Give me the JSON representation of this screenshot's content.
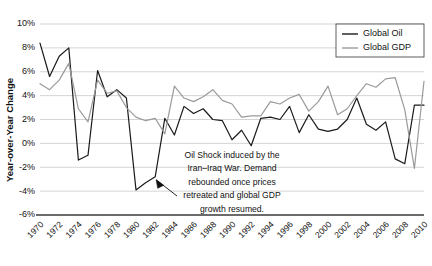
{
  "chart_data": {
    "type": "line",
    "title": "",
    "xlabel": "",
    "ylabel": "Year-over-Year Change",
    "ylim": [
      -6,
      10
    ],
    "xlim": [
      1970,
      2010
    ],
    "ytick_labels": [
      "10%",
      "8%",
      "6%",
      "4%",
      "2%",
      "0%",
      "-2%",
      "-4%",
      "-6%"
    ],
    "ytick_values": [
      10,
      8,
      6,
      4,
      2,
      0,
      -2,
      -4,
      -6
    ],
    "xtick_labels": [
      "1970",
      "1972",
      "1974",
      "1976",
      "1978",
      "1980",
      "1982",
      "1984",
      "1986",
      "1988",
      "1990",
      "1992",
      "1994",
      "1996",
      "1998",
      "2000",
      "2002",
      "2004",
      "2006",
      "2008",
      "2010"
    ],
    "grid": true,
    "legend_position": "top-right",
    "x": [
      1970,
      1971,
      1972,
      1973,
      1974,
      1975,
      1976,
      1977,
      1978,
      1979,
      1980,
      1981,
      1982,
      1983,
      1984,
      1985,
      1986,
      1987,
      1988,
      1989,
      1990,
      1991,
      1992,
      1993,
      1994,
      1995,
      1996,
      1997,
      1998,
      1999,
      2000,
      2001,
      2002,
      2003,
      2004,
      2005,
      2006,
      2007,
      2008,
      2009,
      2010
    ],
    "series": [
      {
        "name": "Global Oil",
        "color": "#1a1a1a",
        "values": [
          8.4,
          5.6,
          7.3,
          8.0,
          -1.4,
          -1.0,
          6.1,
          3.9,
          4.5,
          3.8,
          -3.9,
          -3.3,
          -2.8,
          2.1,
          0.7,
          3.1,
          2.5,
          2.9,
          2.0,
          1.9,
          0.3,
          1.1,
          -0.2,
          2.1,
          2.2,
          2.0,
          3.1,
          0.9,
          2.4,
          1.2,
          1.0,
          1.2,
          2.0,
          3.8,
          1.6,
          1.1,
          1.8,
          -1.3,
          -1.7,
          3.2,
          3.2
        ]
      },
      {
        "name": "Global GDP",
        "color": "#9a9a9a",
        "values": [
          5.0,
          4.5,
          5.3,
          6.7,
          2.9,
          1.8,
          5.3,
          4.2,
          4.4,
          3.0,
          2.2,
          1.9,
          2.1,
          0.8,
          4.8,
          3.8,
          3.5,
          3.9,
          4.5,
          3.6,
          3.3,
          2.2,
          2.3,
          2.3,
          3.5,
          3.3,
          3.8,
          4.1,
          2.7,
          3.5,
          4.8,
          2.4,
          2.9,
          4.0,
          5.0,
          4.7,
          5.4,
          5.5,
          2.8,
          -2.1,
          5.2
        ]
      }
    ],
    "legend": [
      {
        "label": "Global Oil",
        "color": "#1a1a1a"
      },
      {
        "label": "Global GDP",
        "color": "#9a9a9a"
      }
    ],
    "annotations": [
      {
        "name": "oil-shock-annotation",
        "lines": [
          "Oil Shock induced by the",
          "Iran–Iraq War. Demand",
          "rebounded once prices",
          "retreated and global GDP",
          "growth resumed."
        ],
        "points_to_year": 1982,
        "points_to_value": -2.8
      }
    ]
  }
}
